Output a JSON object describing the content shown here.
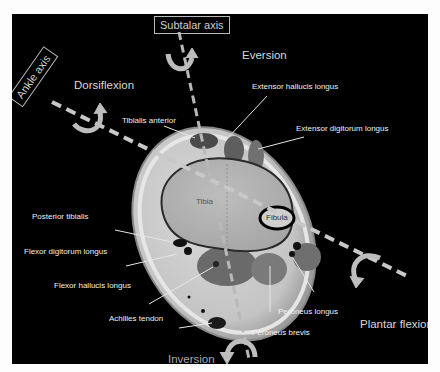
{
  "figure": {
    "axes": {
      "subtalar": "Subtalar axis",
      "ankle": "Ankle axis"
    },
    "motions": {
      "eversion": "Eversion",
      "inversion": "Inversion",
      "dorsiflexion": "Dorsiflexion",
      "plantar_flexion": "Plantar flexion"
    },
    "bones": {
      "tibia": "Tibia",
      "fibula": "Fibula"
    },
    "tendons": [
      {
        "id": "tibialis-anterior",
        "label": "Tibialis anterior"
      },
      {
        "id": "extensor-hallucis-longus",
        "label": "Extensor hallucis longus"
      },
      {
        "id": "extensor-digitorum-longus",
        "label": "Extensor digitorum longus"
      },
      {
        "id": "posterior-tibialis",
        "label": "Posterior tibialis"
      },
      {
        "id": "flexor-digitorum-longus",
        "label": "Flexor digitorum longus"
      },
      {
        "id": "flexor-hallucis-longus",
        "label": "Flexor hallucis longus"
      },
      {
        "id": "achilles-tendon",
        "label": "Achilles tendon"
      },
      {
        "id": "peroneus-longus",
        "label": "Peroneus longus"
      },
      {
        "id": "peroneus-brevis",
        "label": "Peroneus brevis"
      }
    ],
    "colors": {
      "background": "#000000",
      "label_text": "#f0f0f0",
      "axis_dash": "#c8c8c8",
      "arrow": "#bdbdbd"
    }
  }
}
